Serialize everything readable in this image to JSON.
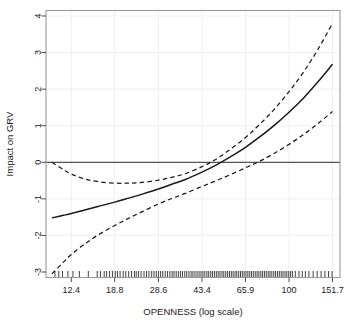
{
  "chart_data": {
    "type": "line",
    "title": "",
    "xlabel": "OPENNESS (log scale)",
    "ylabel": "Impact on GRV",
    "x_scale": "log",
    "grid": true,
    "legend": null,
    "xlim": [
      9.73,
      163.0
    ],
    "ylim": [
      -3.15,
      4.15
    ],
    "x_tick_labels": [
      "12.4",
      "18.8",
      "28.6",
      "43.4",
      "65.9",
      "100",
      "151.7"
    ],
    "x_tick_values": [
      12.4,
      18.8,
      28.6,
      43.4,
      65.9,
      100,
      151.7
    ],
    "y_tick_labels": [
      "-3",
      "-2",
      "-1",
      "0",
      "1",
      "2",
      "3",
      "4"
    ],
    "y_tick_values": [
      -3,
      -2,
      -1,
      0,
      1,
      2,
      3,
      4
    ],
    "reference_line_y": 0,
    "series": [
      {
        "name": "estimate",
        "style": "solid",
        "color": "#1a1a1a",
        "x": [
          10.3,
          11.5,
          12.4,
          14.0,
          16.0,
          18.8,
          21.5,
          24.5,
          28.6,
          32.5,
          37.0,
          43.4,
          49.0,
          56.0,
          65.9,
          75.0,
          86.0,
          100.0,
          115.0,
          132.0,
          151.7
        ],
        "values": [
          -1.52,
          -1.45,
          -1.4,
          -1.31,
          -1.21,
          -1.09,
          -0.98,
          -0.87,
          -0.73,
          -0.6,
          -0.47,
          -0.27,
          -0.1,
          0.12,
          0.41,
          0.68,
          0.99,
          1.37,
          1.76,
          2.2,
          2.68
        ]
      },
      {
        "name": "upper-confidence-band",
        "style": "dashed",
        "color": "#1a1a1a",
        "x": [
          10.3,
          11.5,
          12.4,
          14.0,
          16.0,
          18.8,
          21.5,
          24.5,
          28.6,
          32.5,
          37.0,
          43.4,
          49.0,
          56.0,
          65.9,
          75.0,
          86.0,
          100.0,
          115.0,
          132.0,
          151.7
        ],
        "values": [
          0.0,
          -0.2,
          -0.32,
          -0.45,
          -0.53,
          -0.57,
          -0.57,
          -0.55,
          -0.49,
          -0.41,
          -0.31,
          -0.12,
          0.06,
          0.32,
          0.68,
          1.02,
          1.42,
          1.93,
          2.47,
          3.09,
          3.8
        ]
      },
      {
        "name": "lower-confidence-band",
        "style": "dashed",
        "color": "#1a1a1a",
        "x": [
          10.3,
          11.5,
          12.4,
          14.0,
          16.0,
          18.8,
          21.5,
          24.5,
          28.6,
          32.5,
          37.0,
          43.4,
          49.0,
          56.0,
          65.9,
          75.0,
          86.0,
          100.0,
          115.0,
          132.0,
          151.7
        ],
        "values": [
          -3.05,
          -2.73,
          -2.52,
          -2.25,
          -1.99,
          -1.73,
          -1.53,
          -1.35,
          -1.14,
          -0.99,
          -0.85,
          -0.66,
          -0.52,
          -0.36,
          -0.15,
          0.02,
          0.23,
          0.49,
          0.76,
          1.06,
          1.39
        ]
      }
    ],
    "rug_marks": {
      "name": "data-rug",
      "y_position": -3.15,
      "x": [
        10.6,
        11.0,
        11.4,
        12.0,
        12.6,
        13.4,
        14.6,
        15.9,
        16.4,
        17.0,
        17.4,
        17.9,
        18.4,
        18.9,
        19.3,
        19.8,
        20.4,
        20.9,
        21.5,
        22.1,
        22.7,
        23.1,
        23.6,
        24.2,
        24.9,
        25.5,
        26.1,
        26.8,
        27.4,
        28.0,
        28.6,
        29.2,
        29.8,
        30.5,
        31.2,
        31.9,
        32.6,
        33.2,
        33.9,
        34.6,
        35.3,
        36.0,
        36.8,
        37.5,
        38.3,
        39.1,
        39.8,
        40.6,
        41.4,
        42.2,
        43.0,
        43.8,
        44.6,
        45.5,
        46.3,
        47.2,
        48.0,
        48.9,
        49.8,
        50.7,
        51.6,
        52.6,
        53.5,
        54.5,
        55.5,
        56.5,
        57.5,
        58.5,
        59.6,
        60.6,
        61.7,
        62.8,
        63.9,
        65.0,
        66.2,
        67.4,
        68.6,
        69.8,
        71.0,
        72.3,
        73.6,
        74.9,
        76.3,
        77.6,
        79.0,
        80.4,
        81.9,
        83.3,
        84.8,
        86.4,
        87.9,
        89.5,
        91.1,
        92.8,
        94.4,
        96.2,
        97.9,
        99.7,
        101.5,
        103.3,
        106.2,
        110.0,
        113.5,
        117.0,
        121.0,
        126.0,
        131.0,
        136.0,
        141.0,
        146.0,
        151.0
      ]
    }
  },
  "axes": {
    "y_axis_title": "Impact on GRV",
    "x_axis_title": "OPENNESS (log scale)"
  },
  "colors": {
    "line": "#1a1a1a",
    "grid": "#eeeeee",
    "frame": "#999999",
    "background": "#ffffff",
    "reference_line": "#555555"
  }
}
